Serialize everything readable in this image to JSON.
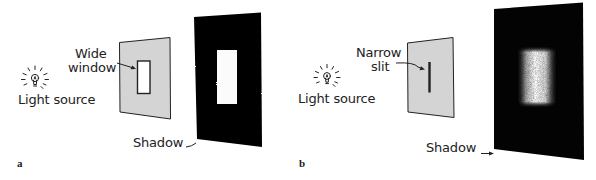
{
  "panels": [
    {
      "letter": "a",
      "light_label": "Light source",
      "aperture_label_line1": "Wide",
      "aperture_label_line2": "window",
      "shadow_label": "Shadow",
      "aperture_type": "wide-window",
      "shadow_pattern": "sharp-edged bright rectangle"
    },
    {
      "letter": "b",
      "light_label": "Light source",
      "aperture_label_line1": "Narrow",
      "aperture_label_line2": "slit",
      "shadow_label": "Shadow",
      "aperture_type": "narrow-slit",
      "shadow_pattern": "diffuse fuzzy bright band"
    }
  ],
  "colors": {
    "screen_fill": "#d4d4d4",
    "shadow_panel": "#050505",
    "outline": "#222222",
    "background": "#ffffff"
  }
}
